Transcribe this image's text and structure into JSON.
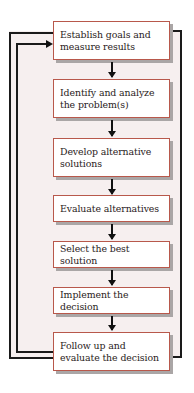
{
  "diagram": {
    "type": "flowchart",
    "steps": [
      {
        "label": "Establish goals and measure results"
      },
      {
        "label": "Identify and analyze the problem(s)"
      },
      {
        "label": "Develop alternative solutions"
      },
      {
        "label": "Evaluate alternatives"
      },
      {
        "label": "Select the best solution"
      },
      {
        "label": "Implement the decision"
      },
      {
        "label": "Follow up and evaluate the decision"
      }
    ],
    "connections": [
      {
        "from": 0,
        "to": 1
      },
      {
        "from": 1,
        "to": 2
      },
      {
        "from": 2,
        "to": 3
      },
      {
        "from": 3,
        "to": 4
      },
      {
        "from": 4,
        "to": 5
      },
      {
        "from": 5,
        "to": 6
      },
      {
        "from": 6,
        "to": 0,
        "type": "feedback-loop-inner"
      },
      {
        "from": 6,
        "to": 0,
        "type": "feedback-loop-outer"
      }
    ],
    "colors": {
      "box_border": "#b8584b",
      "box_fill": "#ffffff",
      "box_shadow": "#aaa6a6",
      "panel_fill": "#f6efef",
      "line": "#1a1a1a"
    }
  }
}
